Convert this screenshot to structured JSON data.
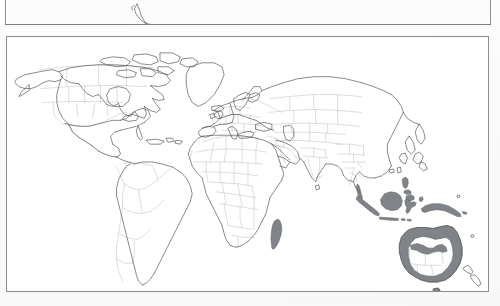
{
  "figure": {
    "type": "world-distribution-map",
    "caption_visible": false,
    "background_color": "#ffffff",
    "page_tint_color": "#fafafa"
  },
  "above_figure": {
    "name": "previous-figure-frame",
    "description": "bottom edge of the preceding map panel, cropped by the screenshot",
    "border_color": "#8e9194",
    "visible_fragment": "southern-south-america-tip"
  },
  "map_panel": {
    "name": "world-map-panel",
    "border_color": "#8a8d90",
    "fill_color": "#ffffff",
    "projection": "equirectangular",
    "coastline_color": "#55585b",
    "country_border_color": "#b9bcbf",
    "highlight_fill_color": "#808488",
    "highlight_stroke_color": "#5e6164",
    "legend_present": false,
    "labels_present": false,
    "graticule_present": false
  },
  "highlighted_regions": [
    {
      "id": "madagascar",
      "label": "Madagascar",
      "shaded": true
    },
    {
      "id": "indonesia-sumatra",
      "label": "Sumatra",
      "shaded": true
    },
    {
      "id": "indonesia-java",
      "label": "Java",
      "shaded": true
    },
    {
      "id": "indonesia-borneo",
      "label": "Borneo",
      "shaded": true
    },
    {
      "id": "indonesia-sulawesi",
      "label": "Sulawesi",
      "shaded": true
    },
    {
      "id": "philippines",
      "label": "Philippines",
      "shaded": true
    },
    {
      "id": "new-guinea",
      "label": "New Guinea",
      "shaded": true
    },
    {
      "id": "australia-coastal-ring",
      "label": "Australia (coastal)",
      "shaded": true
    },
    {
      "id": "malay-peninsula",
      "label": "Malay Peninsula",
      "shaded": true
    }
  ],
  "unshaded_regions": [
    {
      "id": "north-america",
      "label": "North America",
      "shaded": false
    },
    {
      "id": "south-america",
      "label": "South America",
      "shaded": false
    },
    {
      "id": "africa-mainland",
      "label": "Africa",
      "shaded": false
    },
    {
      "id": "europe",
      "label": "Europe",
      "shaded": false
    },
    {
      "id": "asia-mainland",
      "label": "Asia",
      "shaded": false
    },
    {
      "id": "greenland",
      "label": "Greenland",
      "shaded": false
    },
    {
      "id": "new-zealand",
      "label": "New Zealand",
      "shaded": false
    },
    {
      "id": "japan",
      "label": "Japan",
      "shaded": false
    },
    {
      "id": "australia-interior",
      "label": "Australia (interior)",
      "shaded": false
    }
  ]
}
